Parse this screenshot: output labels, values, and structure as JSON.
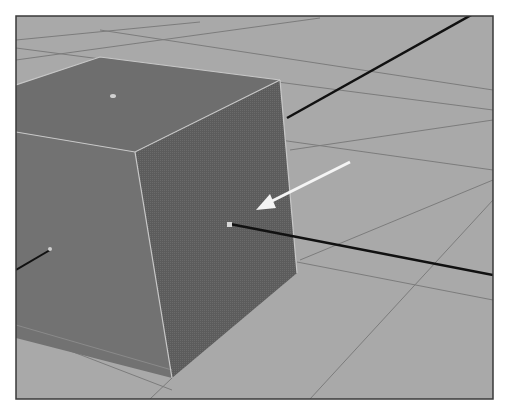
{
  "viewport": {
    "description": "3D modeling viewport showing a selected cube on a ground grid with a pivot/manipulator line and a white arrow pointing at the face center",
    "colors": {
      "background": "#ffffff",
      "ground": "#a9a9a9",
      "grid_line": "#7c7c7c",
      "top_face": "#6e6e6e",
      "left_face": "#727272",
      "right_face": "#5f5f5f",
      "edge_highlight": "#c8c8c8",
      "axis_line": "#111111",
      "arrow": "#f4f4f4",
      "frame": "#3a3a3a"
    },
    "annotations": [
      {
        "type": "arrow",
        "label": "face-center-pointer"
      }
    ]
  }
}
